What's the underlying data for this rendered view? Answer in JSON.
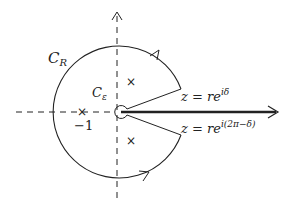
{
  "diagram": {
    "type": "keyhole-contour",
    "colors": {
      "stroke": "#222222",
      "background": "#ffffff"
    },
    "labels": {
      "outer_contour": {
        "main": "C",
        "sub": "R"
      },
      "inner_contour": {
        "main": "C",
        "sub": "ε"
      },
      "point_minus_one": "−1",
      "upper_edge": {
        "base": "z = re",
        "exp": "iδ"
      },
      "lower_edge": {
        "base": "z = re",
        "exp": "i(2π−δ)"
      }
    },
    "markers": [
      {
        "name": "pole-minus-one",
        "symbol": "×"
      },
      {
        "name": "pole-upper",
        "symbol": "×"
      },
      {
        "name": "pole-lower",
        "symbol": "×"
      }
    ]
  }
}
